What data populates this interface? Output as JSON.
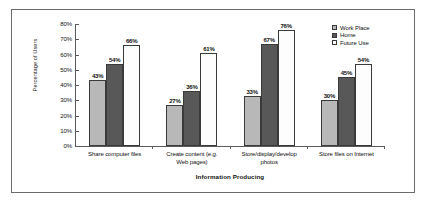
{
  "chart_data": {
    "type": "bar",
    "title": "",
    "xlabel": "Information Producing",
    "ylabel": "Percentage of Users",
    "ylim": [
      0,
      80
    ],
    "ytick_labels": [
      "80%",
      "70%",
      "60%",
      "50%",
      "40%",
      "30%",
      "20%",
      "10%",
      "0%"
    ],
    "ytick_values": [
      80,
      70,
      60,
      50,
      40,
      30,
      20,
      10,
      0
    ],
    "grid": false,
    "legend_position": "top-right",
    "categories": [
      "Share computer files",
      "Create content (e.g. Web pages)",
      "Store/display/develop photos",
      "Store files on Internet"
    ],
    "category_lines": [
      [
        "Share computer files"
      ],
      [
        "Create content (e.g.",
        "Web pages)"
      ],
      [
        "Store/display/develop",
        "photos"
      ],
      [
        "Store files on Internet"
      ]
    ],
    "series": [
      {
        "name": "Work Place",
        "color": "#b8b8b8",
        "values": [
          43,
          27,
          33,
          30
        ],
        "labels": [
          "43%",
          "27%",
          "33%",
          "30%"
        ]
      },
      {
        "name": "Home",
        "color": "#585858",
        "values": [
          54,
          36,
          67,
          45
        ],
        "labels": [
          "54%",
          "36%",
          "67%",
          "45%"
        ]
      },
      {
        "name": "Future Use",
        "color": "#ffffff",
        "values": [
          66,
          61,
          76,
          54
        ],
        "labels": [
          "66%",
          "61%",
          "76%",
          "54%"
        ]
      }
    ]
  },
  "legend": {
    "items": [
      {
        "label": "Work Place"
      },
      {
        "label": "Home"
      },
      {
        "label": "Future Use"
      }
    ]
  }
}
